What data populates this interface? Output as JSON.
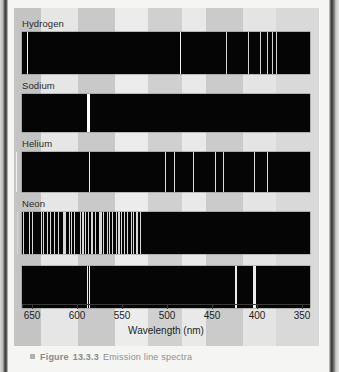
{
  "figure": {
    "title_caption": "Figure 13.3.3 Emission line spectra",
    "caption_prefix": "Figure",
    "caption_number": "13.3.3",
    "caption_text": "Emission line spectra"
  },
  "axis": {
    "label": "Wavelength (nm)",
    "ticks": [
      650,
      600,
      550,
      500,
      450,
      400,
      350
    ],
    "min_nm": 350,
    "max_nm": 670,
    "reversed": true
  },
  "chart_data": {
    "type": "line",
    "title": "Emission line spectra",
    "xlabel": "Wavelength (nm)",
    "ylabel": "",
    "xlim": [
      670,
      340
    ],
    "grid": false,
    "legend": "none",
    "note": "Each series is an emission-line spectrum: bright vertical lines on a black band, plotted against wavelength in nm (axis runs 650 nm left to 350 nm right).",
    "series": [
      {
        "name": "Hydrogen",
        "label": "Hydrogen",
        "lines_nm": [
          656,
          486,
          434,
          410,
          397,
          389,
          383,
          379
        ]
      },
      {
        "name": "Sodium",
        "label": "Sodium",
        "lines_nm": [
          589,
          588
        ]
      },
      {
        "name": "Helium",
        "label": "Helium",
        "lines_nm": [
          668,
          587,
          502,
          492,
          471,
          447,
          438,
          403,
          389
        ]
      },
      {
        "name": "Neon",
        "label": "Neon",
        "lines_nm": [
          667,
          660,
          653,
          650,
          640,
          638,
          633,
          630,
          626,
          621,
          616,
          614,
          609,
          607,
          603,
          597,
          594,
          591,
          588,
          585,
          583,
          580,
          576,
          574,
          571,
          567,
          565,
          561,
          557,
          554,
          551,
          548,
          545,
          540,
          538,
          534,
          533,
          530
        ]
      },
      {
        "name": "Spectrum5",
        "label": "",
        "lines_nm": [
          589,
          587,
          424,
          405,
          403
        ]
      }
    ]
  }
}
